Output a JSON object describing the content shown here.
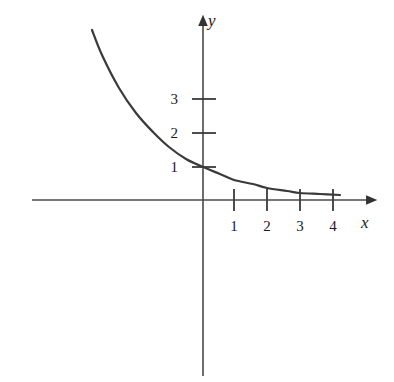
{
  "figure": {
    "background_color": "#ffffff",
    "ink_color": "#333333",
    "text_color": "#1b1b1b",
    "width": 394,
    "height": 382
  },
  "axes": {
    "x_axis_label": "x",
    "y_axis_label": "y",
    "x_axis_label_pos": {
      "left": 361,
      "top": 214
    },
    "y_axis_label_pos": {
      "left": 208,
      "top": 12
    },
    "origin_px": {
      "x": 203,
      "y": 200
    },
    "unit_px": 33.5,
    "x_axis_start_px": 32,
    "x_axis_end_px": 374,
    "y_axis_top_px": 18,
    "y_axis_bottom_px": 376,
    "has_arrow_x": true,
    "has_arrow_y": true,
    "grid": false,
    "legend": false
  },
  "x_ticks": [
    {
      "label": "1",
      "value": 1,
      "px": 234,
      "label_left": 227,
      "label_top": 219
    },
    {
      "label": "2",
      "value": 2,
      "px": 267,
      "label_left": 260,
      "label_top": 219
    },
    {
      "label": "3",
      "value": 3,
      "px": 300,
      "label_left": 293,
      "label_top": 219
    },
    {
      "label": "4",
      "value": 4,
      "px": 333,
      "label_left": 326,
      "label_top": 219
    }
  ],
  "y_ticks": [
    {
      "label": "1",
      "value": 1,
      "px": 167,
      "label_left": 168,
      "label_top": 160
    },
    {
      "label": "2",
      "value": 2,
      "px": 133,
      "label_left": 168,
      "label_top": 126
    },
    {
      "label": "3",
      "value": 3,
      "px": 99,
      "label_left": 168,
      "label_top": 92
    }
  ],
  "chart_data": {
    "type": "line",
    "title": "",
    "subtitle": "",
    "xlabel": "x",
    "ylabel": "y",
    "xlim": [
      -5.1,
      5.1
    ],
    "ylim": [
      -5.3,
      5.4
    ],
    "grid": false,
    "legend_position": "none",
    "annotations": [],
    "series": [
      {
        "name": "exponential decay curve",
        "equation": "y = (0.62)^x",
        "stroke": "#3a3a3a",
        "stroke_width": 2.2,
        "x": [
          -3.3,
          -3.0,
          -2.5,
          -2.0,
          -1.5,
          -1.0,
          -0.5,
          0.0,
          0.5,
          1.0,
          1.5,
          2.0,
          2.5,
          3.0,
          3.5,
          4.0
        ],
        "y": [
          5.07,
          4.33,
          3.36,
          2.6,
          2.02,
          1.57,
          1.21,
          1.0,
          0.78,
          0.6,
          0.47,
          0.36,
          0.28,
          0.22,
          0.17,
          0.13
        ],
        "points_px": [
          {
            "x": 92,
            "y": 30
          },
          {
            "x": 102,
            "y": 55
          },
          {
            "x": 119,
            "y": 88
          },
          {
            "x": 136,
            "y": 113
          },
          {
            "x": 153,
            "y": 132
          },
          {
            "x": 169,
            "y": 147
          },
          {
            "x": 186,
            "y": 159
          },
          {
            "x": 203,
            "y": 167
          },
          {
            "x": 220,
            "y": 174
          },
          {
            "x": 234,
            "y": 180
          },
          {
            "x": 253,
            "y": 184
          },
          {
            "x": 267,
            "y": 188
          },
          {
            "x": 287,
            "y": 191
          },
          {
            "x": 300,
            "y": 193
          },
          {
            "x": 320,
            "y": 194
          },
          {
            "x": 340,
            "y": 195
          }
        ]
      }
    ]
  }
}
